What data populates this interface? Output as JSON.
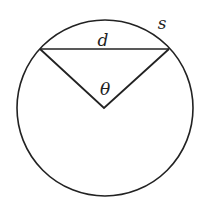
{
  "diagram": {
    "stroke_color": "#222222",
    "background": "#ffffff",
    "circle": {
      "cx": 105,
      "cy": 108,
      "r": 88
    },
    "chord": {
      "x1": 40,
      "y1": 49,
      "x2": 169,
      "y2": 49
    },
    "center_vertex": {
      "x": 104,
      "y": 108
    },
    "labels": {
      "chord": "d",
      "arc": "s",
      "angle": "θ"
    }
  }
}
